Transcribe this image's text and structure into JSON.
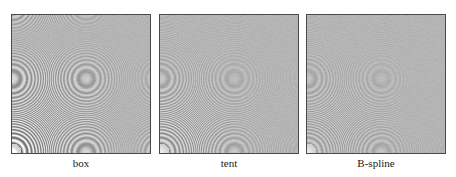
{
  "figure": {
    "background": "#ffffff",
    "panel_border_color": "#4a4a4a",
    "panel_gray": "#b4b4b4",
    "panels": [
      {
        "label": "box",
        "alias_strength": 1.0,
        "corner_echoes": true,
        "ring_falloff": 0.9
      },
      {
        "label": "tent",
        "alias_strength": 0.45,
        "corner_echoes": false,
        "ring_falloff": 1.6
      },
      {
        "label": "B-spline",
        "alias_strength": 0.25,
        "corner_echoes": false,
        "ring_falloff": 2.4
      }
    ]
  }
}
